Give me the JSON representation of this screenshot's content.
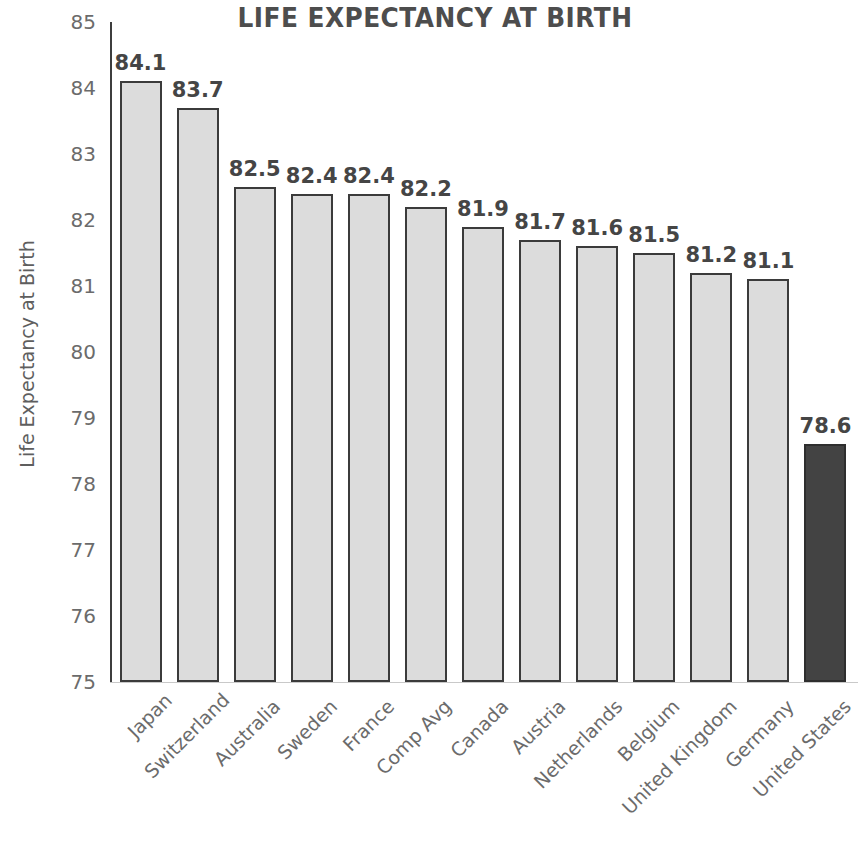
{
  "chart_data": {
    "type": "bar",
    "title": "LIFE EXPECTANCY AT BIRTH",
    "xlabel": "",
    "ylabel": "Life Expectancy at Birth",
    "ylim": [
      75,
      85
    ],
    "grid": false,
    "legend": "none",
    "y_ticks": [
      85,
      84,
      83,
      82,
      81,
      80,
      79,
      78,
      77,
      76,
      75
    ],
    "categories": [
      "Japan",
      "Switzerland",
      "Australia",
      "Sweden",
      "France",
      "Comp Avg",
      "Canada",
      "Austria",
      "Netherlands",
      "Belgium",
      "United Kingdom",
      "Germany",
      "United States"
    ],
    "values": [
      84.1,
      83.7,
      82.5,
      82.4,
      82.4,
      82.2,
      81.9,
      81.7,
      81.6,
      81.5,
      81.2,
      81.1,
      78.6
    ],
    "value_labels": [
      "84.1",
      "83.7",
      "82.5",
      "82.4",
      "82.4",
      "82.2",
      "81.9",
      "81.7",
      "81.6",
      "81.5",
      "81.2",
      "81.1",
      "78.6"
    ],
    "highlight_index": 12,
    "colors": {
      "bar_fill": "#dcdcdc",
      "bar_border": "#3b3b3b",
      "highlight_fill": "#434343",
      "highlight_border": "#2e2e2e",
      "title_text": "#4d4d4d",
      "value_text": "#454545",
      "tick_text": "#6b6b6b",
      "axis_title_text": "#5e5e5e",
      "axis_line": "#3d3d3d",
      "baseline": "#c9c9c9",
      "background": "#ffffff"
    }
  }
}
